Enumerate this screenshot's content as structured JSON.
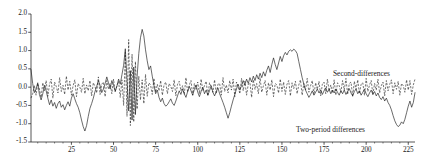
{
  "chart_data": {
    "type": "line",
    "title": "",
    "subtitle": "",
    "xlabel": "",
    "ylabel": "",
    "xlim": [
      1,
      229
    ],
    "ylim": [
      -1.5,
      2.0
    ],
    "grid": false,
    "legend_position": "inline-annotation",
    "yticks": [
      "2.0",
      "1.5",
      "1.0",
      "0.5",
      "0.0",
      "-0.5",
      "-1.0",
      "-1.5"
    ],
    "ytick_values": [
      2.0,
      1.5,
      1.0,
      0.5,
      0.0,
      -0.5,
      -1.0,
      -1.5
    ],
    "xticks": [
      "25",
      "50",
      "75",
      "100",
      "125",
      "150",
      "175",
      "200",
      "225"
    ],
    "xtick_values": [
      25,
      50,
      75,
      100,
      125,
      150,
      175,
      200,
      225
    ],
    "x_start": 1,
    "x_step": 1,
    "series": [
      {
        "name": "Second-differences",
        "style": "dashed",
        "color": "#1a1a1a",
        "label_x": 225,
        "label_y": 0.38,
        "values": [
          -0.3,
          -0.18,
          0.05,
          -0.22,
          0.1,
          -0.05,
          -0.28,
          0.12,
          -0.1,
          0.18,
          -0.25,
          0.08,
          0.22,
          -0.3,
          0.14,
          0.02,
          -0.16,
          0.26,
          -0.12,
          0.05,
          -0.2,
          0.3,
          -0.08,
          0.16,
          -0.22,
          0.04,
          0.2,
          -0.26,
          0.1,
          0.0,
          -0.14,
          0.24,
          -0.18,
          0.06,
          -0.1,
          0.18,
          -0.24,
          0.12,
          0.02,
          -0.16,
          0.28,
          -0.2,
          0.08,
          0.14,
          -0.26,
          0.18,
          -0.06,
          0.1,
          -0.18,
          0.22,
          -0.12,
          0.04,
          0.16,
          -0.28,
          0.2,
          -0.5,
          0.95,
          -0.8,
          1.3,
          -1.05,
          0.9,
          -0.95,
          0.7,
          -0.6,
          0.3,
          -0.35,
          0.2,
          -0.45,
          0.35,
          -0.25,
          0.12,
          0.06,
          -0.2,
          0.24,
          -0.14,
          0.08,
          -0.1,
          0.18,
          -0.22,
          0.06,
          0.14,
          -0.18,
          0.1,
          0.02,
          -0.12,
          0.2,
          -0.24,
          0.08,
          0.16,
          -0.1,
          0.04,
          -0.2,
          0.26,
          -0.14,
          0.06,
          0.18,
          -0.22,
          0.1,
          -0.06,
          0.14,
          -0.18,
          0.22,
          -0.1,
          0.04,
          0.16,
          -0.24,
          0.12,
          0.0,
          -0.14,
          0.2,
          -0.18,
          0.08,
          0.1,
          -0.22,
          0.26,
          -0.12,
          0.06,
          -0.16,
          0.18,
          -0.08,
          0.22,
          -0.26,
          0.14,
          0.02,
          -0.18,
          0.24,
          -0.1,
          0.16,
          -0.22,
          0.08,
          0.12,
          -0.28,
          0.2,
          -0.06,
          0.1,
          -0.18,
          0.26,
          -0.14,
          0.04,
          0.18,
          -0.22,
          0.12,
          -0.08,
          0.2,
          -0.26,
          0.1,
          0.06,
          -0.16,
          0.22,
          -0.12,
          0.14,
          -0.2,
          0.08,
          0.18,
          -0.24,
          0.12,
          -0.04,
          0.16,
          -0.18,
          0.06,
          0.2,
          -0.22,
          0.1,
          -0.08,
          0.24,
          -0.14,
          0.04,
          0.18,
          -0.2,
          0.12,
          -0.06,
          0.16,
          -0.24,
          0.08,
          0.14,
          -0.18,
          0.22,
          -0.1,
          0.06,
          -0.16,
          0.2,
          -0.22,
          0.12,
          0.04,
          -0.14,
          0.18,
          -0.08,
          0.24,
          -0.2,
          0.1,
          0.14,
          -0.26,
          0.16,
          -0.06,
          0.2,
          -0.18,
          0.08,
          0.12,
          -0.22,
          0.24,
          -0.12,
          0.06,
          0.18,
          -0.2,
          0.1,
          -0.08,
          0.22,
          -0.16,
          0.04,
          0.14,
          -0.24,
          0.18,
          -0.1,
          0.08,
          0.2,
          -0.18,
          0.12,
          -0.06,
          0.16,
          -0.22,
          0.1,
          0.04,
          -0.14,
          0.2,
          -0.08,
          0.18,
          -0.2,
          0.06,
          0.22
        ]
      },
      {
        "name": "Two-period differences",
        "style": "solid",
        "color": "#1a1a1a",
        "label_x": 215,
        "label_y": -1.15,
        "values": [
          0.48,
          0.1,
          -0.15,
          -0.05,
          0.12,
          -0.2,
          -0.35,
          -0.18,
          0.05,
          -0.1,
          -0.3,
          -0.48,
          -0.35,
          -0.52,
          -0.42,
          -0.58,
          -0.45,
          -0.38,
          -0.55,
          -0.48,
          -0.62,
          -0.5,
          -0.4,
          -0.52,
          -0.3,
          -0.18,
          -0.32,
          -0.45,
          -0.55,
          -0.7,
          -0.9,
          -1.08,
          -1.2,
          -1.05,
          -0.8,
          -0.58,
          -0.45,
          -0.3,
          -0.12,
          0.02,
          0.18,
          0.05,
          -0.15,
          -0.05,
          0.1,
          0.28,
          0.12,
          -0.05,
          0.18,
          0.05,
          -0.12,
          0.02,
          0.22,
          0.08,
          0.34,
          0.6,
          1.05,
          0.2,
          -0.65,
          0.45,
          -0.9,
          0.55,
          -0.75,
          0.3,
          0.92,
          1.35,
          1.58,
          1.4,
          1.02,
          0.72,
          0.48,
          0.58,
          0.3,
          0.05,
          -0.18,
          -0.08,
          -0.28,
          -0.4,
          -0.3,
          -0.45,
          -0.52,
          -0.48,
          -0.4,
          -0.32,
          -0.44,
          -0.5,
          -0.38,
          -0.24,
          -0.1,
          -0.2,
          -0.05,
          -0.18,
          -0.28,
          -0.12,
          0.02,
          -0.1,
          -0.22,
          -0.06,
          0.06,
          -0.14,
          -0.26,
          -0.12,
          0.0,
          -0.18,
          -0.08,
          -0.22,
          -0.1,
          0.04,
          -0.14,
          -0.24,
          -0.12,
          -0.02,
          -0.18,
          -0.3,
          -0.42,
          -0.55,
          -0.7,
          -0.85,
          -0.7,
          -0.52,
          -0.35,
          -0.2,
          -0.05,
          0.08,
          -0.08,
          0.04,
          0.18,
          0.06,
          0.22,
          0.1,
          0.26,
          0.14,
          0.3,
          0.18,
          0.34,
          0.22,
          0.38,
          0.26,
          0.42,
          0.3,
          0.46,
          0.58,
          0.4,
          0.62,
          0.8,
          0.62,
          0.48,
          0.66,
          0.84,
          0.7,
          0.86,
          0.95,
          0.88,
          0.98,
          1.02,
          0.98,
          1.04,
          1.0,
          0.92,
          0.7,
          0.48,
          0.26,
          0.08,
          -0.08,
          -0.18,
          -0.28,
          -0.2,
          -0.1,
          -0.22,
          -0.14,
          -0.05,
          -0.16,
          -0.08,
          -0.2,
          -0.1,
          -0.02,
          -0.14,
          -0.06,
          -0.18,
          -0.08,
          -0.16,
          -0.05,
          -0.14,
          -0.22,
          -0.1,
          -0.18,
          -0.08,
          -0.2,
          -0.12,
          -0.04,
          -0.16,
          -0.24,
          -0.12,
          -0.05,
          -0.18,
          -0.1,
          -0.22,
          -0.14,
          -0.06,
          -0.18,
          -0.26,
          -0.16,
          -0.08,
          -0.2,
          -0.12,
          -0.24,
          -0.16,
          -0.28,
          -0.34,
          -0.26,
          -0.38,
          -0.3,
          -0.42,
          -0.5,
          -0.62,
          -0.78,
          -0.92,
          -1.02,
          -1.08,
          -1.04,
          -0.95,
          -1.0,
          -0.88,
          -0.7,
          -0.52,
          -0.38,
          -0.55,
          -0.42,
          -0.15
        ]
      }
    ]
  }
}
